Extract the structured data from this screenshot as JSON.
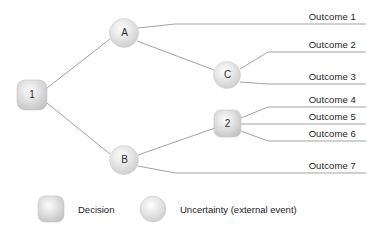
{
  "diagram": {
    "type": "decision-tree",
    "background_color": "#ffffff",
    "line_color": "#8a8a8a",
    "text_color": "#1d1d1d",
    "decision_node_color": "#d0d0d0",
    "uncertainty_node_color": "#d8d8d8"
  },
  "nodes": [
    {
      "id": "n1",
      "label": "1",
      "kind": "decision",
      "shape": "rounded-square",
      "cx": 32,
      "cy": 95,
      "size": 30
    },
    {
      "id": "nA",
      "label": "A",
      "kind": "uncertainty",
      "shape": "circle",
      "cx": 124,
      "cy": 33,
      "size": 29
    },
    {
      "id": "nC",
      "label": "C",
      "kind": "uncertainty",
      "shape": "circle",
      "cx": 227,
      "cy": 75,
      "size": 27
    },
    {
      "id": "nB",
      "label": "B",
      "kind": "uncertainty",
      "shape": "circle",
      "cx": 124,
      "cy": 160,
      "size": 29
    },
    {
      "id": "n2",
      "label": "2",
      "kind": "decision",
      "shape": "rounded-square",
      "cx": 228,
      "cy": 124,
      "size": 27
    }
  ],
  "outcomes": [
    {
      "id": "o1",
      "label": "Outcome 1",
      "rule_y": 24,
      "label_right": 18,
      "label_y": 11
    },
    {
      "id": "o2",
      "label": "Outcome 2",
      "rule_y": 52,
      "label_right": 18,
      "label_y": 39
    },
    {
      "id": "o3",
      "label": "Outcome 3",
      "rule_y": 84,
      "label_right": 18,
      "label_y": 71
    },
    {
      "id": "o4",
      "label": "Outcome 4",
      "rule_y": 107,
      "label_right": 18,
      "label_y": 94
    },
    {
      "id": "o5",
      "label": "Outcome 5",
      "rule_y": 124,
      "label_right": 18,
      "label_y": 111
    },
    {
      "id": "o6",
      "label": "Outcome 6",
      "rule_y": 141,
      "label_right": 18,
      "label_y": 128
    },
    {
      "id": "o7",
      "label": "Outcome 7",
      "rule_y": 173,
      "label_right": 18,
      "label_y": 160
    }
  ],
  "edges": [
    {
      "from": "n1",
      "to": "nA",
      "note": "upper branch from decision 1 to uncertainty A"
    },
    {
      "from": "n1",
      "to": "nB",
      "note": "lower branch from decision 1 to uncertainty B"
    },
    {
      "from": "nA",
      "to": "o1",
      "note": "A leads to Outcome 1"
    },
    {
      "from": "nA",
      "to": "nC",
      "note": "A leads to uncertainty C"
    },
    {
      "from": "nC",
      "to": "o2",
      "note": "C leads to Outcome 2"
    },
    {
      "from": "nC",
      "to": "o3",
      "note": "C leads to Outcome 3"
    },
    {
      "from": "nB",
      "to": "n2",
      "note": "B leads to decision 2"
    },
    {
      "from": "nB",
      "to": "o7",
      "note": "B leads to Outcome 7"
    },
    {
      "from": "n2",
      "to": "o4",
      "note": "decision 2 leads to Outcome 4"
    },
    {
      "from": "n2",
      "to": "o5",
      "note": "decision 2 leads to Outcome 5"
    },
    {
      "from": "n2",
      "to": "o6",
      "note": "decision 2 leads to Outcome 6"
    }
  ],
  "legend": {
    "items": [
      {
        "id": "legend-decision",
        "shape": "rounded-square",
        "label": "Decision",
        "swatch_x": 38,
        "swatch_y": 196,
        "swatch_size": 26,
        "label_x": 78
      },
      {
        "id": "legend-uncertainty",
        "shape": "circle",
        "label": "Uncertainty (external event)",
        "swatch_x": 140,
        "swatch_y": 196,
        "swatch_size": 26,
        "label_x": 180
      }
    ]
  },
  "margin_text": {
    "visible": true,
    "lines": [
      "",
      "",
      "",
      "",
      ""
    ],
    "note": "faint cropped text column at right edge of page"
  }
}
